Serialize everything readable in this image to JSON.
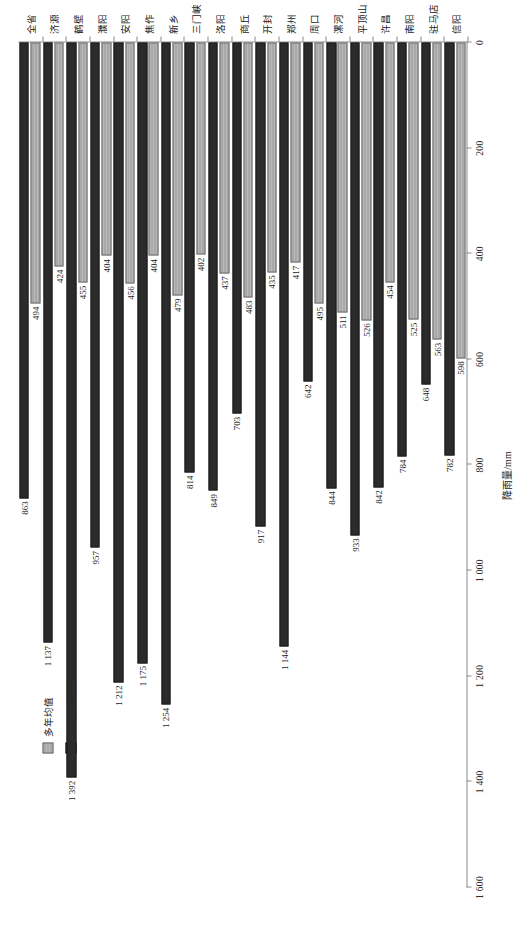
{
  "chart_data": {
    "type": "bar",
    "orientation": "horizontal",
    "title": "",
    "xlabel": "",
    "ylabel": "降雨量/mm",
    "value_axis_label": "降雨量/mm",
    "value_axis_ticks": [
      "1 600",
      "1 400",
      "1 200",
      "1 000",
      "800",
      "600",
      "400",
      "200",
      "0"
    ],
    "value_axis_tick_values": [
      1600,
      1400,
      1200,
      1000,
      800,
      600,
      400,
      200,
      0
    ],
    "xlim": [
      0,
      1600
    ],
    "axis_reversed": true,
    "grid": false,
    "legend_position": "upper-left",
    "categories": [
      "全省",
      "济源",
      "鹤壁",
      "濮阳",
      "安阳",
      "焦作",
      "新乡",
      "三门峡",
      "洛阳",
      "商丘",
      "开封",
      "郑州",
      "周口",
      "漯河",
      "平顶山",
      "许昌",
      "南阳",
      "驻马店",
      "信阳"
    ],
    "series": [
      {
        "name": "多年均值",
        "color": "#a9a9a9",
        "values": [
          494,
          424,
          455,
          404,
          456,
          404,
          479,
          402,
          437,
          483,
          435,
          417,
          495,
          511,
          526,
          454,
          525,
          563,
          598
        ]
      },
      {
        "name": "6~9月降雨量",
        "color": "#2b2b2b",
        "values": [
          863,
          1137,
          1392,
          957,
          1212,
          1175,
          1254,
          814,
          849,
          703,
          917,
          1144,
          642,
          844,
          933,
          842,
          784,
          648,
          782
        ]
      }
    ],
    "value_labels": {
      "多年均值": [
        "494",
        "424",
        "455",
        "404",
        "456",
        "404",
        "479",
        "402",
        "437",
        "483",
        "435",
        "417",
        "495",
        "511",
        "526",
        "454",
        "525",
        "563",
        "598"
      ],
      "6~9月降雨量": [
        "863",
        "1 137",
        "1 392",
        "957",
        "1 212",
        "1 175",
        "1 254",
        "814",
        "849",
        "703",
        "917",
        "1 144",
        "642",
        "844",
        "933",
        "842",
        "784",
        "648",
        "782"
      ]
    }
  },
  "legend": {
    "items": [
      {
        "label": "多年均值",
        "swatch": "light"
      },
      {
        "label": "6~9月降雨量",
        "swatch": "dark"
      }
    ]
  }
}
